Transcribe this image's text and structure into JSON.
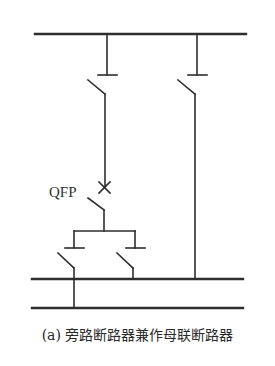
{
  "diagram": {
    "type": "electrical single-line diagram",
    "stroke_color": "#2e2e2e",
    "breaker_label": "QFP",
    "caption": "(a) 旁路断路器兼作母联断路器",
    "buses": [
      {
        "name": "top-bus",
        "x1": 35,
        "x2": 246,
        "y": 34
      },
      {
        "name": "middle-bus",
        "x1": 32,
        "x2": 243,
        "y": 279
      },
      {
        "name": "bottom-bus",
        "x1": 32,
        "x2": 243,
        "y": 308
      }
    ]
  }
}
